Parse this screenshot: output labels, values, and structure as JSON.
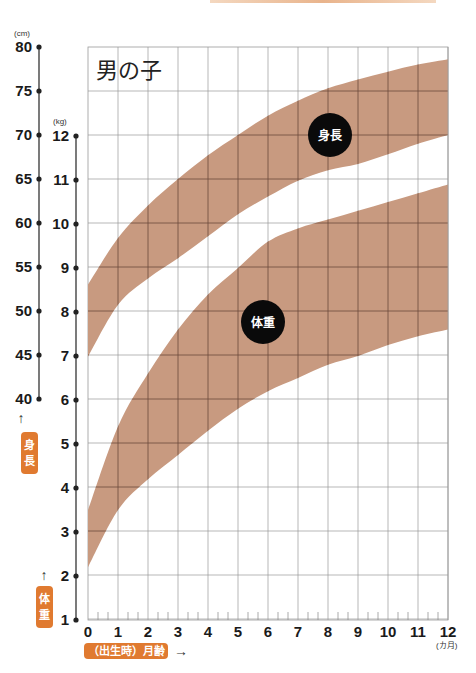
{
  "chart_data": {
    "type": "area",
    "title": "男の子",
    "xlabel": "（出生時）月齢",
    "x_unit": "(カ月)",
    "x": [
      0,
      1,
      2,
      3,
      4,
      5,
      6,
      7,
      8,
      9,
      10,
      11,
      12
    ],
    "x_ticks": [
      "0",
      "1",
      "2",
      "3",
      "4",
      "5",
      "6",
      "7",
      "8",
      "9",
      "10",
      "11",
      "12"
    ],
    "height_axis": {
      "label": "身長",
      "unit": "(cm)",
      "ticks": [
        "40",
        "45",
        "50",
        "55",
        "60",
        "65",
        "70",
        "75",
        "80"
      ],
      "range": [
        40,
        80
      ]
    },
    "weight_axis": {
      "label": "体重",
      "unit": "(kg)",
      "ticks": [
        "1",
        "2",
        "3",
        "4",
        "5",
        "6",
        "7",
        "8",
        "9",
        "10",
        "11",
        "12"
      ],
      "range": [
        1,
        12
      ]
    },
    "series": [
      {
        "name": "身長",
        "unit": "cm",
        "upper": [
          53.0,
          58.3,
          62.0,
          65.0,
          67.7,
          70.0,
          72.2,
          73.9,
          75.3,
          76.3,
          77.2,
          78.0,
          78.6
        ],
        "lower": [
          44.8,
          50.7,
          53.7,
          56.0,
          58.5,
          61.0,
          63.0,
          64.8,
          66.0,
          66.7,
          67.8,
          69.0,
          70.0
        ]
      },
      {
        "name": "体重",
        "unit": "kg",
        "upper": [
          3.5,
          5.4,
          6.6,
          7.6,
          8.4,
          9.0,
          9.6,
          9.9,
          10.1,
          10.3,
          10.5,
          10.7,
          10.9
        ],
        "lower": [
          2.2,
          3.5,
          4.2,
          4.75,
          5.3,
          5.8,
          6.2,
          6.5,
          6.8,
          7.0,
          7.25,
          7.45,
          7.6
        ]
      }
    ],
    "grid": true,
    "band_color": "#c89a80",
    "accent_color": "#e07a30"
  },
  "labels": {
    "title": "男の子",
    "height_badge": "身長",
    "weight_badge": "体重",
    "height_circle": "身長",
    "weight_circle": "体重",
    "x_badge": "（出生時）月齢",
    "cm_unit": "(cm)",
    "kg_unit": "(kg)",
    "month_unit": "(カ月)",
    "up_arrow": "↑",
    "right_arrow": "→"
  }
}
